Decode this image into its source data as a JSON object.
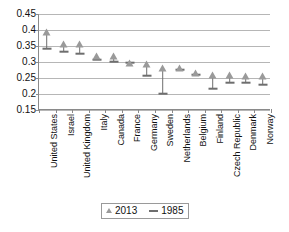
{
  "chart_data": {
    "type": "scatter",
    "title": "",
    "subtitle": "",
    "xlabel": "",
    "ylabel": "",
    "grid": true,
    "legend_position": "bottom",
    "ylim": [
      0.15,
      0.45
    ],
    "yticks": [
      "0.45",
      "0.4",
      "0.35",
      "0.3",
      "0.25",
      "0.2",
      "0.15"
    ],
    "ytick_values": [
      0.45,
      0.4,
      0.35,
      0.3,
      0.25,
      0.2,
      0.15
    ],
    "categories": [
      "United States",
      "Israel",
      "United Kingdom",
      "Italy",
      "Canada",
      "France",
      "Germany",
      "Sweden",
      "Netherlands",
      "Belgium",
      "Finland",
      "Czech Republic",
      "Denmark",
      "Norway"
    ],
    "series": [
      {
        "name": "2013",
        "marker": "triangle",
        "color": "#9a9a9a",
        "values": [
          0.395,
          0.355,
          0.355,
          0.32,
          0.32,
          0.298,
          0.295,
          0.28,
          0.28,
          0.265,
          0.26,
          0.26,
          0.255,
          0.255
        ]
      },
      {
        "name": "1985",
        "marker": "dash",
        "color": "#6e6e6e",
        "values": [
          0.34,
          0.33,
          0.325,
          0.305,
          0.3,
          0.298,
          0.255,
          0.2,
          0.275,
          0.26,
          0.215,
          0.235,
          0.235,
          0.228
        ]
      }
    ]
  },
  "legend": {
    "items": [
      {
        "label": "2013",
        "marker": "triangle-icon"
      },
      {
        "label": "1985",
        "marker": "dash-icon"
      }
    ]
  }
}
